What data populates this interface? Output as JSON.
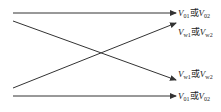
{
  "diagram": {
    "labels": [
      {
        "id": "top",
        "v1": "V",
        "s1": "01",
        "mid": "或",
        "v2": "V",
        "s2": "02"
      },
      {
        "id": "second",
        "v1": "V",
        "s1": "w1",
        "mid": "或",
        "v2": "V",
        "s2": "w2"
      },
      {
        "id": "third",
        "v1": "V",
        "s1": "w1",
        "mid": "或",
        "v2": "V",
        "s2": "w2"
      },
      {
        "id": "bottom",
        "v1": "V",
        "s1": "01",
        "mid": "或",
        "v2": "V",
        "s2": "02"
      }
    ],
    "lines": [
      {
        "name": "top-horizontal-arrow",
        "from": [
          13,
          13
        ],
        "to": [
          176,
          13
        ]
      },
      {
        "name": "descending-diagonal-arrow",
        "from": [
          13,
          21
        ],
        "to": [
          176,
          80
        ]
      },
      {
        "name": "ascending-diagonal-arrow",
        "from": [
          13,
          88
        ],
        "to": [
          176,
          23
        ]
      },
      {
        "name": "bottom-horizontal-arrow",
        "from": [
          13,
          96
        ],
        "to": [
          176,
          96
        ]
      }
    ],
    "line_color": "#333333"
  }
}
